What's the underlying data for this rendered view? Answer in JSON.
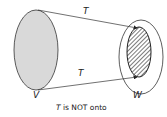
{
  "diagram": {
    "domain_label": "V",
    "codomain_label": "W",
    "arrow_top_label": "T",
    "arrow_bottom_label": "T",
    "caption_italic": "T",
    "caption_rest": " is NOT onto",
    "colors": {
      "domain_fill": "#d9d9d9",
      "stroke": "#333333",
      "hatch": "#333333",
      "background": "#ffffff"
    }
  }
}
